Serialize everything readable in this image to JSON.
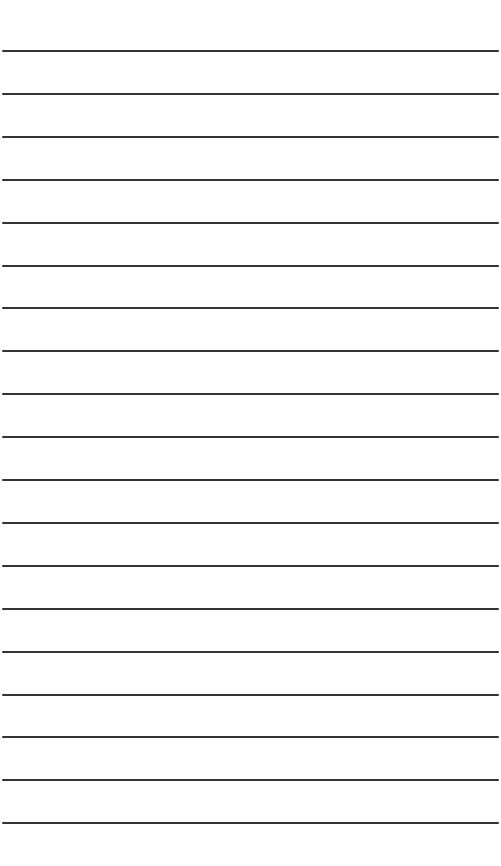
{
  "page": {
    "type": "lined-paper",
    "background_color": "#ffffff",
    "line_color": "#333333",
    "line_count": 19,
    "first_line_y": 51,
    "line_spacing": 42.9,
    "lines": [
      {
        "text": ""
      },
      {
        "text": ""
      },
      {
        "text": ""
      },
      {
        "text": ""
      },
      {
        "text": ""
      },
      {
        "text": ""
      },
      {
        "text": ""
      },
      {
        "text": ""
      },
      {
        "text": ""
      },
      {
        "text": ""
      },
      {
        "text": ""
      },
      {
        "text": ""
      },
      {
        "text": ""
      },
      {
        "text": ""
      },
      {
        "text": ""
      },
      {
        "text": ""
      },
      {
        "text": ""
      },
      {
        "text": ""
      },
      {
        "text": ""
      }
    ]
  }
}
